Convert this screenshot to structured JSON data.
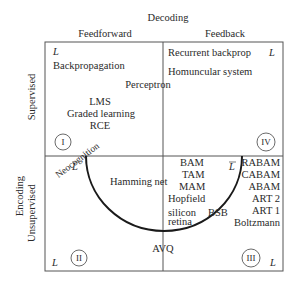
{
  "axes": {
    "top_title": "Decoding",
    "top_left": "Feedforward",
    "top_right": "Feedback",
    "side_title": "Encoding",
    "side_top": "Supervised",
    "side_bottom": "Unsupervised"
  },
  "quadrants": {
    "q1": {
      "numeral": "I",
      "marker": "L",
      "items": [
        "Backpropagation"
      ]
    },
    "q4": {
      "numeral": "IV",
      "marker": "L",
      "items": [
        "Recurrent backprop",
        "Homuncular system"
      ]
    },
    "q2": {
      "numeral": "II",
      "marker": "L"
    },
    "q3": {
      "numeral": "III",
      "marker": "L",
      "items": [
        "RABAM",
        "CABAM",
        "ABAM",
        "ART 2",
        "ART 1",
        "Boltzmann"
      ]
    }
  },
  "center_items": {
    "perceptron": "Perceptron",
    "lms": "LMS",
    "graded": "Graded learning",
    "rce": "RCE",
    "neocognition": "Neocognition",
    "hamming": "Hamming net",
    "bam": "BAM",
    "tam": "TAM",
    "mam": "MAM",
    "hopfield": "Hopfield",
    "silicon": "silicon",
    "retina": "retina",
    "bsb": "BSB",
    "avq": "AVQ",
    "lbar_left": "L",
    "lbar_right": "L"
  }
}
